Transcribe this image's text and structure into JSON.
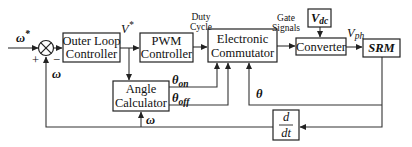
{
  "diagram": {
    "blocks": {
      "outer_loop": {
        "line1": "Outer Loop",
        "line2": "Controller"
      },
      "pwm": {
        "line1": "PWM",
        "line2": "Controller"
      },
      "commutator": {
        "line1": "Electronic",
        "line2": "Commutator"
      },
      "converter": {
        "label": "Converter"
      },
      "vdc": {
        "label": "V",
        "sub": "dc"
      },
      "srm": {
        "label": "SRM"
      },
      "angle_calc": {
        "line1": "Angle",
        "line2": "Calculator"
      },
      "derivative": {
        "num": "d",
        "den": "dt"
      }
    },
    "signals": {
      "omega_ref": "ω",
      "omega_ref_sup": "*",
      "plus": "+",
      "minus": "−",
      "omega_fb": "ω",
      "omega_angle": "ω",
      "v_star": "V",
      "v_star_sup": "*",
      "duty_line1": "Duty",
      "duty_line2": "Cycle",
      "gate_line1": "Gate",
      "gate_line2": "Signals",
      "vph": "V",
      "vph_sub": "ph",
      "theta_on": "θ",
      "theta_on_sub": "on",
      "theta_off": "θ",
      "theta_off_sub": "off",
      "theta": "θ"
    },
    "colors": {
      "stroke": "#222222",
      "background": "#ffffff"
    }
  }
}
